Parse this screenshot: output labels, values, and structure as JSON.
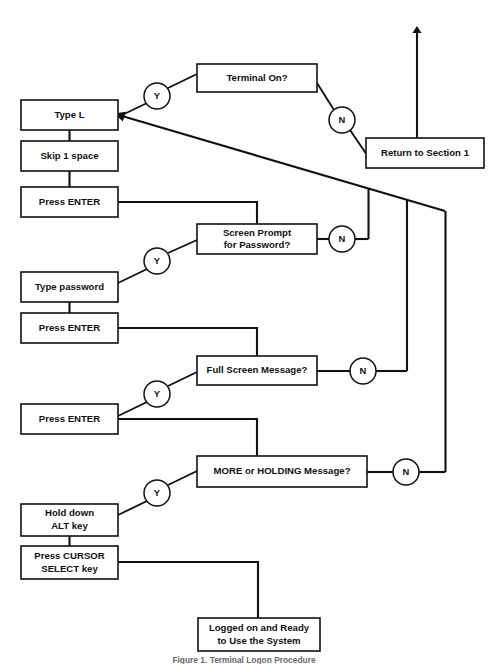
{
  "diagram": {
    "caption": "Figure 1. Terminal Logon Procedure",
    "stroke_color": "#111111",
    "background_color": "#ffffff",
    "boxes": [
      {
        "id": "terminal-on",
        "label_lines": [
          "Terminal On?"
        ],
        "x": 197,
        "y": 64,
        "w": 120,
        "h": 28,
        "kind": "decision"
      },
      {
        "id": "type-l",
        "label_lines": [
          "Type L"
        ],
        "x": 21,
        "y": 100,
        "w": 97,
        "h": 30,
        "kind": "process"
      },
      {
        "id": "return-section-1",
        "label_lines": [
          "Return to Section 1"
        ],
        "x": 366,
        "y": 138,
        "w": 118,
        "h": 30,
        "kind": "process"
      },
      {
        "id": "skip-1-space",
        "label_lines": [
          "Skip 1 space"
        ],
        "x": 21,
        "y": 141,
        "w": 97,
        "h": 30,
        "kind": "process"
      },
      {
        "id": "press-enter-1",
        "label_lines": [
          "Press ENTER"
        ],
        "x": 21,
        "y": 187,
        "w": 97,
        "h": 30,
        "kind": "process"
      },
      {
        "id": "screen-prompt-password",
        "label_lines": [
          "Screen Prompt",
          "for Password?"
        ],
        "x": 197,
        "y": 224,
        "w": 120,
        "h": 30,
        "kind": "decision"
      },
      {
        "id": "type-password",
        "label_lines": [
          "Type password"
        ],
        "x": 21,
        "y": 272,
        "w": 97,
        "h": 30,
        "kind": "process"
      },
      {
        "id": "press-enter-2",
        "label_lines": [
          "Press ENTER"
        ],
        "x": 21,
        "y": 313,
        "w": 97,
        "h": 30,
        "kind": "process"
      },
      {
        "id": "full-screen-message",
        "label_lines": [
          "Full Screen Message?"
        ],
        "x": 197,
        "y": 356,
        "w": 120,
        "h": 29,
        "kind": "decision"
      },
      {
        "id": "press-enter-3",
        "label_lines": [
          "Press ENTER"
        ],
        "x": 21,
        "y": 404,
        "w": 97,
        "h": 30,
        "kind": "process"
      },
      {
        "id": "more-or-holding",
        "label_lines": [
          "MORE or HOLDING Message?"
        ],
        "x": 197,
        "y": 456,
        "w": 170,
        "h": 31,
        "kind": "decision"
      },
      {
        "id": "hold-down-alt",
        "label_lines": [
          "Hold down",
          "ALT key"
        ],
        "x": 21,
        "y": 504,
        "w": 97,
        "h": 32,
        "kind": "process"
      },
      {
        "id": "press-cursor-select",
        "label_lines": [
          "Press CURSOR",
          "SELECT key"
        ],
        "x": 21,
        "y": 546,
        "w": 97,
        "h": 33,
        "kind": "process"
      },
      {
        "id": "logged-on-ready",
        "label_lines": [
          "Logged on and Ready",
          "to Use the System"
        ],
        "x": 198,
        "y": 618,
        "w": 122,
        "h": 33,
        "kind": "terminal"
      }
    ],
    "branch_nodes": [
      {
        "id": "yes-terminal-on",
        "label": "Y",
        "cx": 157,
        "cy": 96,
        "r": 13
      },
      {
        "id": "no-terminal-on",
        "label": "N",
        "cx": 342,
        "cy": 120,
        "r": 13
      },
      {
        "id": "no-screen-prompt",
        "label": "N",
        "cx": 342,
        "cy": 239,
        "r": 13
      },
      {
        "id": "yes-screen-prompt",
        "label": "Y",
        "cx": 157,
        "cy": 261,
        "r": 13
      },
      {
        "id": "no-full-screen",
        "label": "N",
        "cx": 363,
        "cy": 371,
        "r": 13
      },
      {
        "id": "yes-full-screen",
        "label": "Y",
        "cx": 157,
        "cy": 394,
        "r": 13
      },
      {
        "id": "no-more-holding",
        "label": "N",
        "cx": 406,
        "cy": 472,
        "r": 13
      },
      {
        "id": "yes-more-holding",
        "label": "Y",
        "cx": 157,
        "cy": 493,
        "r": 13
      }
    ],
    "connectors": [
      {
        "id": "exit-up-arrow",
        "from": "return-section-1",
        "to": "section-1-offpage",
        "has_arrow": true
      },
      {
        "id": "terminal-on-yes-to-type-l",
        "from": "terminal-on",
        "to": "type-l",
        "label": "Y",
        "has_arrow": true
      },
      {
        "id": "terminal-on-no-to-return",
        "from": "terminal-on",
        "to": "return-section-1",
        "label": "N",
        "has_arrow": false
      },
      {
        "id": "type-l-to-skip",
        "from": "type-l",
        "to": "skip-1-space",
        "has_arrow": false
      },
      {
        "id": "skip-to-press-enter-1",
        "from": "skip-1-space",
        "to": "press-enter-1",
        "has_arrow": false
      },
      {
        "id": "press-enter-1-to-screen-prompt",
        "from": "press-enter-1",
        "to": "screen-prompt-password",
        "has_arrow": false
      },
      {
        "id": "screen-prompt-yes-to-type-password",
        "from": "screen-prompt-password",
        "to": "type-password",
        "label": "Y",
        "has_arrow": false
      },
      {
        "id": "screen-prompt-no-to-loop",
        "from": "screen-prompt-password",
        "to": "loop-back-to-type-l",
        "label": "N",
        "has_arrow": false
      },
      {
        "id": "type-password-to-press-enter-2",
        "from": "type-password",
        "to": "press-enter-2",
        "has_arrow": false
      },
      {
        "id": "press-enter-2-to-full-screen",
        "from": "press-enter-2",
        "to": "full-screen-message",
        "has_arrow": false
      },
      {
        "id": "full-screen-yes-to-press-enter-3",
        "from": "full-screen-message",
        "to": "press-enter-3",
        "label": "Y",
        "has_arrow": false
      },
      {
        "id": "full-screen-no-to-loop",
        "from": "full-screen-message",
        "to": "loop-back-to-type-l",
        "label": "N",
        "has_arrow": false
      },
      {
        "id": "press-enter-3-to-more-holding",
        "from": "press-enter-3",
        "to": "more-or-holding",
        "has_arrow": false
      },
      {
        "id": "more-holding-yes-to-alt",
        "from": "more-or-holding",
        "to": "hold-down-alt",
        "label": "Y",
        "has_arrow": false
      },
      {
        "id": "more-holding-no-to-loop",
        "from": "more-or-holding",
        "to": "loop-back-to-type-l",
        "label": "N",
        "has_arrow": false
      },
      {
        "id": "alt-to-cursor-select",
        "from": "hold-down-alt",
        "to": "press-cursor-select",
        "has_arrow": false
      },
      {
        "id": "cursor-select-to-logged-on",
        "from": "press-cursor-select",
        "to": "logged-on-ready",
        "has_arrow": false
      }
    ]
  }
}
